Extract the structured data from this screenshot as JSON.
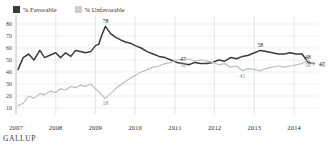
{
  "legend": {
    "items": [
      {
        "label": "% Favorable",
        "color": "#3b3b3b",
        "key": "favorable"
      },
      {
        "label": "% Unfavorable",
        "color": "#bdbdbd",
        "key": "unfavorable"
      }
    ]
  },
  "footer": {
    "brand": "GALLUP"
  },
  "chart_data": {
    "type": "line",
    "title": "",
    "subtitle": "",
    "xlabel": "",
    "ylabel": "",
    "grid": true,
    "legend_position": "top-left",
    "ylim": [
      5,
      85
    ],
    "yticks": [
      10,
      20,
      30,
      40,
      50,
      60,
      70,
      80
    ],
    "xlim": [
      2007,
      2014.6
    ],
    "xticks": [
      2007,
      2008,
      2009,
      2010,
      2011,
      2012,
      2013,
      2014
    ],
    "xtick_labels": [
      "2007",
      "2008",
      "2009",
      "2010",
      "2011",
      "2012",
      "2013",
      "2014"
    ],
    "series": [
      {
        "name": "% Favorable",
        "color": "#3b3b3b",
        "x": [
          2007.05,
          2007.18,
          2007.32,
          2007.45,
          2007.6,
          2007.72,
          2007.85,
          2008.0,
          2008.12,
          2008.25,
          2008.38,
          2008.5,
          2008.62,
          2008.75,
          2008.88,
          2009.0,
          2009.08,
          2009.15,
          2009.25,
          2009.38,
          2009.5,
          2009.62,
          2009.75,
          2009.88,
          2010.0,
          2010.15,
          2010.3,
          2010.45,
          2010.6,
          2010.75,
          2010.9,
          2011.05,
          2011.2,
          2011.35,
          2011.5,
          2011.65,
          2011.8,
          2011.95,
          2012.1,
          2012.25,
          2012.4,
          2012.55,
          2012.7,
          2012.85,
          2013.0,
          2013.15,
          2013.3,
          2013.45,
          2013.6,
          2013.75,
          2013.9,
          2014.05,
          2014.2,
          2014.35,
          2014.5
        ],
        "values": [
          42,
          52,
          55,
          50,
          58,
          52,
          54,
          56,
          52,
          56,
          53,
          58,
          57,
          56,
          57,
          62,
          63,
          70,
          78,
          72,
          69,
          67,
          65,
          64,
          62,
          60,
          57,
          55,
          53,
          52,
          50,
          48,
          47,
          46,
          48,
          47,
          47,
          48,
          50,
          49,
          52,
          51,
          53,
          54,
          56,
          58,
          57,
          56,
          55,
          55,
          56,
          55,
          55,
          48,
          47
        ],
        "labeled_points": [
          {
            "x": 2009.25,
            "value": 78,
            "label": "78",
            "position": "above"
          },
          {
            "x": 2011.2,
            "value": 47,
            "label": "47",
            "position": "above"
          },
          {
            "x": 2013.15,
            "value": 58,
            "label": "58",
            "position": "above"
          },
          {
            "x": 2014.35,
            "value": 48,
            "label": "48",
            "position": "above"
          },
          {
            "x": 2014.5,
            "value": 47,
            "label": "47",
            "position": "right"
          }
        ]
      },
      {
        "name": "% Unfavorable",
        "color": "#bdbdbd",
        "x": [
          2007.05,
          2007.18,
          2007.32,
          2007.45,
          2007.6,
          2007.72,
          2007.85,
          2008.0,
          2008.12,
          2008.25,
          2008.38,
          2008.5,
          2008.62,
          2008.75,
          2008.88,
          2009.0,
          2009.08,
          2009.15,
          2009.25,
          2009.38,
          2009.5,
          2009.62,
          2009.75,
          2009.88,
          2010.0,
          2010.15,
          2010.3,
          2010.45,
          2010.6,
          2010.75,
          2010.9,
          2011.05,
          2011.2,
          2011.35,
          2011.5,
          2011.65,
          2011.8,
          2011.95,
          2012.1,
          2012.25,
          2012.4,
          2012.55,
          2012.7,
          2012.85,
          2013.0,
          2013.15,
          2013.3,
          2013.45,
          2013.6,
          2013.75,
          2013.9,
          2014.05,
          2014.2,
          2014.35,
          2014.5
        ],
        "values": [
          12,
          14,
          20,
          18,
          22,
          21,
          24,
          23,
          26,
          25,
          28,
          27,
          29,
          28,
          30,
          26,
          24,
          21,
          18,
          22,
          26,
          29,
          32,
          35,
          37,
          40,
          42,
          44,
          45,
          47,
          48,
          50,
          50,
          51,
          49,
          50,
          49,
          48,
          46,
          47,
          44,
          45,
          41,
          43,
          42,
          41,
          43,
          44,
          45,
          44,
          45,
          46,
          47,
          50,
          46
        ],
        "labeled_points": [
          {
            "x": 2009.25,
            "value": 18,
            "label": "18",
            "position": "below"
          },
          {
            "x": 2011.2,
            "value": 50,
            "label": "50",
            "position": "below"
          },
          {
            "x": 2012.7,
            "value": 41,
            "label": "41",
            "position": "below"
          },
          {
            "x": 2014.35,
            "value": 50,
            "label": "50",
            "position": "below"
          },
          {
            "x": 2014.5,
            "value": 46,
            "label": "46",
            "position": "right"
          }
        ]
      }
    ]
  }
}
